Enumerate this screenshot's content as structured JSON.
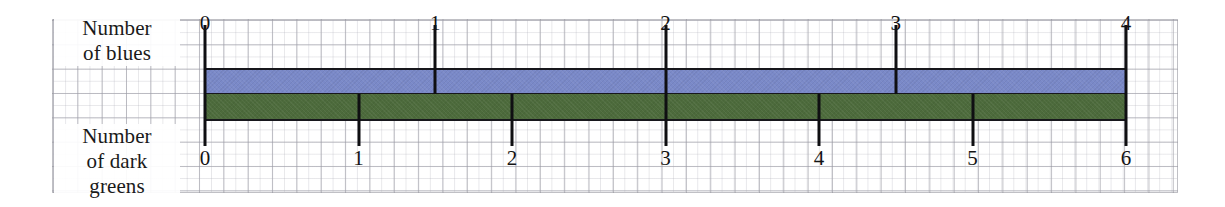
{
  "diagram": {
    "type": "double-number-line",
    "axis_top": {
      "label": "Number\nof blues",
      "label_line1": "Number",
      "label_line2": "of blues",
      "bar_color": "#7a89c8",
      "ticks": [
        "0",
        "1",
        "2",
        "3",
        "4"
      ],
      "max": 4
    },
    "axis_bottom": {
      "label": "Number\nof dark\ngreens",
      "label_line1": "Number",
      "label_line2": "of dark",
      "label_line3": "greens",
      "bar_color": "#4d6b3c",
      "ticks": [
        "0",
        "1",
        "2",
        "3",
        "4",
        "5",
        "6"
      ],
      "max": 6
    },
    "ratio": "4 blues : 6 dark greens",
    "background": "graph-paper-grid"
  },
  "chart_data": {
    "type": "line",
    "title": "",
    "subtitle": "",
    "xlabel": "",
    "ylabel": "",
    "grid": true,
    "legend_position": "none",
    "series": [
      {
        "name": "Number of blues",
        "color": "#7a89c8",
        "tick_labels": [
          "0",
          "1",
          "2",
          "3",
          "4"
        ],
        "values": [
          0,
          1,
          2,
          3,
          4
        ],
        "axis_range": [
          0,
          4
        ]
      },
      {
        "name": "Number of dark greens",
        "color": "#4d6b3c",
        "tick_labels": [
          "0",
          "1",
          "2",
          "3",
          "4",
          "5",
          "6"
        ],
        "values": [
          0,
          1,
          2,
          3,
          4,
          5,
          6
        ],
        "axis_range": [
          0,
          6
        ]
      }
    ],
    "annotations": [
      "0 blues aligns with 0 dark greens",
      "4 blues aligns with 6 dark greens"
    ]
  }
}
